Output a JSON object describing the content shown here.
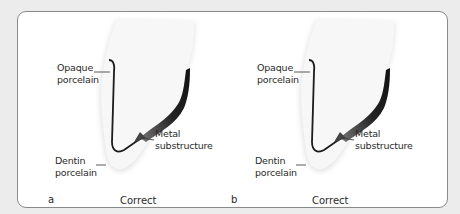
{
  "figure": {
    "panels": [
      {
        "letter": "a",
        "caption": "Correct",
        "labels": {
          "opaque_line1": "Opaque",
          "opaque_line2": "porcelain",
          "metal_line1": "Metal",
          "metal_line2": "substructure",
          "dentin_line1": "Dentin",
          "dentin_line2": "porcelain"
        }
      },
      {
        "letter": "b",
        "caption": "Correct",
        "labels": {
          "opaque_line1": "Opaque",
          "opaque_line2": "porcelain",
          "metal_line1": "Metal",
          "metal_line2": "substructure",
          "dentin_line1": "Dentin",
          "dentin_line2": "porcelain"
        }
      }
    ],
    "colors": {
      "background": "#ececec",
      "frame_border": "#8a8a8a",
      "metal": "#1a1a1a",
      "porcelain": "#f4f4f4"
    }
  }
}
